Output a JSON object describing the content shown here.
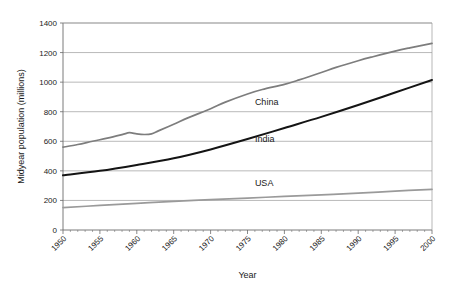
{
  "chart_data": {
    "type": "line",
    "title": "",
    "xlabel": "Year",
    "ylabel": "Midyear population (millions)",
    "xlim": [
      1950,
      2000
    ],
    "ylim": [
      0,
      1400
    ],
    "ytick_step": 200,
    "xtick_step": 5,
    "minor_xtick_step": 1,
    "grid": "horizontal",
    "legend": "inline-labels",
    "ytick_labels": [
      "0",
      "200",
      "400",
      "600",
      "800",
      "1000",
      "1200",
      "1400"
    ],
    "ytick_values": [
      0,
      200,
      400,
      600,
      800,
      1000,
      1200,
      1400
    ],
    "xtick_labels": [
      "1950",
      "1955",
      "1960",
      "1965",
      "1970",
      "1975",
      "1980",
      "1985",
      "1990",
      "1995",
      "2000"
    ],
    "xtick_values": [
      1950,
      1955,
      1960,
      1965,
      1970,
      1975,
      1980,
      1985,
      1990,
      1995,
      2000
    ],
    "x": [
      1950,
      1955,
      1960,
      1965,
      1970,
      1975,
      1980,
      1985,
      1990,
      1995,
      2000
    ],
    "series": [
      {
        "name": "China",
        "color": "#7d7d7d",
        "label_year": 1976,
        "label_value": 845,
        "x": [
          1950,
          1952,
          1954,
          1956,
          1958,
          1959,
          1960,
          1961,
          1962,
          1963,
          1965,
          1967,
          1970,
          1972,
          1975,
          1977,
          1980,
          1982,
          1985,
          1987,
          1990,
          1992,
          1995,
          1997,
          2000
        ],
        "values": [
          560,
          578,
          600,
          621,
          645,
          658,
          650,
          646,
          650,
          672,
          715,
          760,
          820,
          865,
          920,
          950,
          985,
          1015,
          1065,
          1100,
          1145,
          1172,
          1210,
          1232,
          1262
        ]
      },
      {
        "name": "India",
        "color": "#141414",
        "label_year": 1976,
        "label_value": 595,
        "x": [
          1950,
          1955,
          1960,
          1965,
          1970,
          1975,
          1980,
          1985,
          1990,
          1995,
          2000
        ],
        "values": [
          370,
          400,
          440,
          485,
          545,
          615,
          690,
          765,
          845,
          930,
          1015
        ]
      },
      {
        "name": "USA",
        "color": "#9a9a9a",
        "label_year": 1976,
        "label_value": 300,
        "x": [
          1950,
          1955,
          1960,
          1965,
          1970,
          1975,
          1980,
          1985,
          1990,
          1995,
          2000
        ],
        "values": [
          152,
          166,
          180,
          194,
          205,
          216,
          227,
          238,
          249,
          263,
          275
        ]
      }
    ]
  }
}
